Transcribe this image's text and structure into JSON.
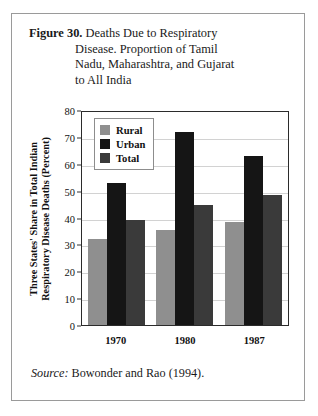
{
  "figure": {
    "label": "Figure 30.",
    "title_lines": [
      "Deaths Due to Respiratory",
      "Disease. Proportion of Tamil",
      "Nadu, Maharashtra, and Gujarat",
      "to All India"
    ],
    "source_prefix": "Source:",
    "source_text": "Bowonder and Rao (1994)."
  },
  "chart_data": {
    "type": "bar",
    "title": "Figure 30. Deaths Due to Respiratory Disease. Proportion of Tamil Nadu, Maharashtra, and Gujarat to All India",
    "categories": [
      "1970",
      "1980",
      "1987"
    ],
    "series": [
      {
        "name": "Rural",
        "color": "#8f8f8f",
        "values": [
          32,
          35.5,
          38.5
        ]
      },
      {
        "name": "Urban",
        "color": "#151515",
        "values": [
          53,
          72,
          63
        ]
      },
      {
        "name": "Total",
        "color": "#3a3a3a",
        "values": [
          39,
          44.5,
          48.5
        ]
      }
    ],
    "xlabel": "",
    "ylabel": "Three States' Share in Total Indian Respiratory Disease Deaths (Percent)",
    "ylabel_lines": [
      "Three States' Share in Total Indian",
      "Respiratory Disease Deaths (Percent)"
    ],
    "ylim": [
      0,
      80
    ],
    "ytick_values": [
      0,
      10,
      20,
      30,
      40,
      50,
      60,
      70,
      80
    ],
    "ytick_labels": [
      "0",
      "10",
      "20",
      "30",
      "40",
      "50",
      "60",
      "70",
      "80"
    ],
    "grid": true,
    "legend_position": "top-left",
    "legend_entries": [
      "Rural",
      "Urban",
      "Total"
    ]
  }
}
